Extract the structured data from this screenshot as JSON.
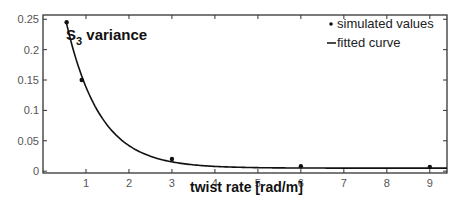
{
  "chart_data": {
    "type": "scatter",
    "title": "",
    "annotation": {
      "main": "S",
      "sub": "3",
      "rest": " variance"
    },
    "xlabel": "twist rate [rad/m]",
    "ylabel": "",
    "xlim": [
      0,
      9.4
    ],
    "ylim": [
      -0.003,
      0.257
    ],
    "xticks": [
      1,
      2,
      3,
      4,
      5,
      6,
      7,
      8,
      9
    ],
    "xtick_labels": [
      "1",
      "2",
      "3",
      "4",
      "5",
      "6",
      "7",
      "8",
      "9"
    ],
    "yticks": [
      0,
      0.05,
      0.1,
      0.15,
      0.2,
      0.25
    ],
    "ytick_labels": [
      "0",
      "0.05",
      "0.1",
      "0.15",
      "0.2",
      "0.25"
    ],
    "grid": false,
    "legend_position": "top-right",
    "series": [
      {
        "name": "simulated values",
        "kind": "scatter",
        "x": [
          0.55,
          0.9,
          3,
          6,
          9
        ],
        "y": [
          0.245,
          0.15,
          0.02,
          0.008,
          0.007
        ]
      },
      {
        "name": "fitted curve",
        "kind": "line",
        "model": "a*exp(-b*x)+c",
        "params": {
          "a": 0.48,
          "b": 1.28,
          "c": 0.005
        },
        "x_range": [
          0.5,
          9.4
        ]
      }
    ],
    "legend": [
      {
        "symbol": "•",
        "label": "simulated values"
      },
      {
        "symbol": "—",
        "label": "fitted curve"
      }
    ],
    "colors": {
      "axis": "#333333",
      "marks": "#111111",
      "tick_text": "#555555"
    }
  }
}
